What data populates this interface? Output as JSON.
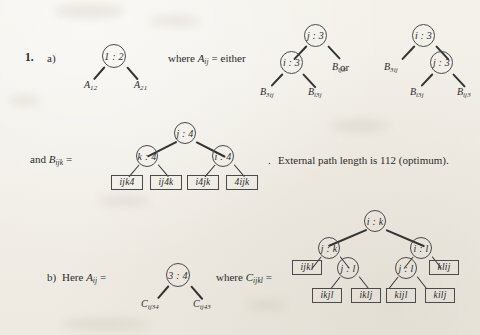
{
  "page": {
    "background_color": "#f2efe9",
    "ink_color": "#2b2b2b",
    "item_number": "1.",
    "part_a_label": "a)",
    "part_b_label": "b)"
  },
  "part_a": {
    "tree_a_root": "1 : 2",
    "tree_a_leaf_left": "A",
    "tree_a_leaf_left_sub": "12",
    "tree_a_leaf_right": "A",
    "tree_a_leaf_right_sub": "21",
    "where_text_1": "where",
    "where_symbol": "A",
    "where_symbol_sub": "ij",
    "equals": "=",
    "either_text": "either",
    "or_text": "or",
    "alt1": {
      "root": "j : 3",
      "inner": "i : 3",
      "right_leaf_base": "B",
      "right_leaf_sub": "ij3",
      "inner_left_leaf_base": "B",
      "inner_left_leaf_sub": "3ij",
      "inner_right_leaf_base": "B",
      "inner_right_leaf_sub": "i3j"
    },
    "alt2": {
      "root": "i : 3",
      "inner": "j : 3",
      "left_leaf_base": "B",
      "left_leaf_sub": "3ij",
      "inner_left_leaf_base": "B",
      "inner_left_leaf_sub": "i3j",
      "inner_right_leaf_base": "B",
      "inner_right_leaf_sub": "ij3"
    }
  },
  "part_a_second_row": {
    "and_text": "and",
    "symbol": "B",
    "symbol_sub": "ijk",
    "equals": "=",
    "tree": {
      "root": "j : 4",
      "left": "k : 4",
      "right": "i : 4",
      "leaves": [
        "ijk4",
        "ij4k",
        "i4jk",
        "4ijk"
      ]
    },
    "period": ".",
    "note": "External path length is 112 (optimum)."
  },
  "part_b": {
    "here_text": "Here",
    "symbol": "A",
    "symbol_sub": "ij",
    "equals": "=",
    "tree_root": "3 : 4",
    "leaf_left_base": "C",
    "leaf_left_sub": "ij34",
    "leaf_right_base": "C",
    "leaf_right_sub": "ij43",
    "where_text": "where",
    "where_symbol": "C",
    "where_symbol_sub": "ijkl",
    "where_equals": "=",
    "tree": {
      "root": "i : k",
      "left": "j : k",
      "right": "i : l",
      "left_inner": "j : l",
      "right_inner": "j : l",
      "leaf_ijkl": "ijkl",
      "leaf_klij": "klij",
      "leaves_left_inner": [
        "ikjl",
        "iklj"
      ],
      "leaves_right_inner": [
        "kijl",
        "kilj"
      ]
    }
  }
}
